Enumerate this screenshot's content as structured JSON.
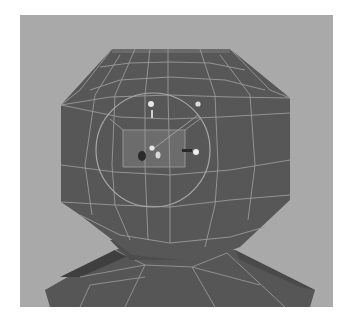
{
  "viewport": {
    "label": "3D viewport",
    "background_color": "#a9a9a9",
    "mesh_color": "#5a5a5a",
    "wire_color": "#9c9c9c",
    "objects": [
      {
        "name": "head",
        "type": "polygon-mesh",
        "shape": "low-poly sphere"
      },
      {
        "name": "shoulders",
        "type": "polygon-mesh",
        "shape": "low-poly body"
      }
    ],
    "selection": {
      "component": "face",
      "highlight_color": "#6e6e6e"
    },
    "manipulator": {
      "type": "soft-modification / transform gizmo",
      "ring_color": "#a8a8a8",
      "handle_color": "#e6e6e6"
    }
  }
}
